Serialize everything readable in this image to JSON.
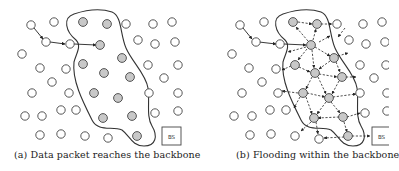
{
  "figure": {
    "panels": [
      {
        "id": "a",
        "caption": "(a) Data packet reaches the backbone",
        "base_station_label": "BS"
      },
      {
        "id": "b",
        "caption": "(b) Flooding within the backbone",
        "base_station_label": "BS"
      }
    ],
    "legend": {
      "white_node": "ordinary sensor node",
      "gray_node": "backbone node"
    },
    "colors": {
      "node_fill_white": "#ffffff",
      "node_fill_gray": "#c8c8c8",
      "stroke": "#333333"
    }
  }
}
